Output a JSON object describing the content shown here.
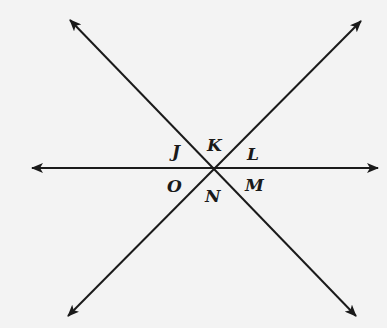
{
  "diagram": {
    "type": "intersecting-lines",
    "intersection": {
      "x": 213,
      "y": 168
    },
    "line_color": "#1a1a1a",
    "background": "#f3f3f3",
    "lines": [
      {
        "id": "horizontal",
        "from": {
          "x": 32,
          "y": 168
        },
        "to": {
          "x": 378,
          "y": 168
        },
        "arrows": "both"
      },
      {
        "id": "diagonal-down",
        "from": {
          "x": 70,
          "y": 20
        },
        "to": {
          "x": 356,
          "y": 316
        },
        "arrows": "both"
      },
      {
        "id": "diagonal-up",
        "from": {
          "x": 68,
          "y": 316
        },
        "to": {
          "x": 361,
          "y": 21
        },
        "arrows": "both"
      }
    ],
    "angle_labels": [
      {
        "name": "J",
        "text": "J",
        "x": 172,
        "y": 143
      },
      {
        "name": "K",
        "text": "K",
        "x": 207,
        "y": 137
      },
      {
        "name": "L",
        "text": "L",
        "x": 247,
        "y": 146
      },
      {
        "name": "O",
        "text": "O",
        "x": 167,
        "y": 178
      },
      {
        "name": "N",
        "text": "N",
        "x": 205,
        "y": 188
      },
      {
        "name": "M",
        "text": "M",
        "x": 245,
        "y": 177
      }
    ]
  }
}
